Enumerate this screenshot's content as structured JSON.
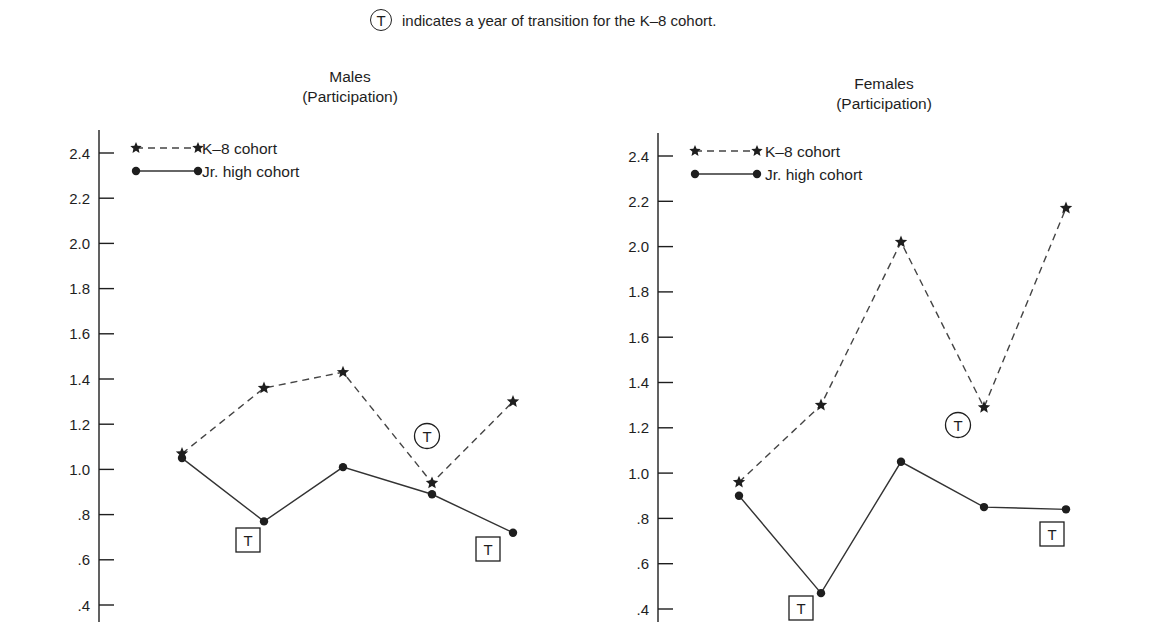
{
  "note": {
    "symbol": "T",
    "text": "indicates a year of transition for the K–8 cohort."
  },
  "panels": [
    {
      "title": "Males",
      "subtitle": "(Participation)"
    },
    {
      "title": "Females",
      "subtitle": "(Participation)"
    }
  ],
  "legend": {
    "k8": "K–8 cohort",
    "jr": "Jr. high cohort"
  },
  "colors": {
    "ink": "#1e1e1e",
    "dash": "#444444",
    "background": "#ffffff"
  },
  "chart_data": [
    {
      "type": "line",
      "title": "Males (Participation)",
      "xlabel": "",
      "ylabel": "",
      "ylim": [
        0.4,
        2.4
      ],
      "yticks": [
        "2.4",
        "2.2",
        "2.0",
        "1.8",
        "1.6",
        "1.4",
        "1.2",
        "1.0",
        ".8",
        ".6",
        ".4"
      ],
      "x": [
        1,
        2,
        3,
        4,
        5
      ],
      "grid": false,
      "legend_position": "upper left",
      "series": [
        {
          "name": "K–8 cohort",
          "style": "dashed, star markers",
          "values": [
            1.07,
            1.36,
            1.43,
            0.94,
            1.3
          ]
        },
        {
          "name": "Jr. high cohort",
          "style": "solid, dot markers",
          "values": [
            1.05,
            0.77,
            1.01,
            0.89,
            0.72
          ]
        }
      ],
      "annotations": [
        {
          "type": "circled T",
          "series": "K–8 cohort",
          "x": 4,
          "meaning": "transition year for K–8 cohort"
        },
        {
          "type": "boxed T",
          "series": "Jr. high cohort",
          "x": 2
        },
        {
          "type": "boxed T",
          "series": "Jr. high cohort",
          "x": 5
        }
      ]
    },
    {
      "type": "line",
      "title": "Females (Participation)",
      "xlabel": "",
      "ylabel": "",
      "ylim": [
        0.4,
        2.4
      ],
      "yticks": [
        "2.4",
        "2.2",
        "2.0",
        "1.8",
        "1.6",
        "1.4",
        "1.2",
        "1.0",
        ".8",
        ".6",
        ".4"
      ],
      "x": [
        1,
        2,
        3,
        4,
        5
      ],
      "grid": false,
      "legend_position": "upper left",
      "series": [
        {
          "name": "K–8 cohort",
          "style": "dashed, star markers",
          "values": [
            0.96,
            1.3,
            2.02,
            1.29,
            2.17
          ]
        },
        {
          "name": "Jr. high cohort",
          "style": "solid, dot markers",
          "values": [
            0.9,
            0.47,
            1.05,
            0.85,
            0.84
          ]
        }
      ],
      "annotations": [
        {
          "type": "circled T",
          "series": "K–8 cohort",
          "x": 4,
          "meaning": "transition year for K–8 cohort"
        },
        {
          "type": "boxed T",
          "series": "Jr. high cohort",
          "x": 2
        },
        {
          "type": "boxed T",
          "series": "Jr. high cohort",
          "x": 5
        }
      ]
    }
  ]
}
